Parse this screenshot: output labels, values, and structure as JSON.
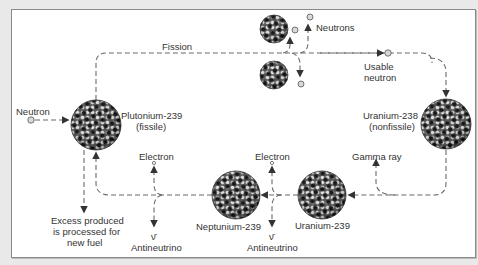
{
  "diagram": {
    "title_hint": "Plutonium breeding cycle",
    "colors": {
      "background": "#e9e9e9",
      "panel": "#ffffff",
      "line": "#6a6a6a",
      "text": "#333333",
      "proton": "#111111",
      "neutron_particle": "#dcdcdc"
    },
    "labels": {
      "fission": "Fission",
      "neutrons": "Neutrons",
      "usable_neutron_1": "Usable",
      "usable_neutron_2": "neutron",
      "neutron_in": "Neutron",
      "pu239_1": "Plutonium-239",
      "pu239_2": "(fissile)",
      "u238_1": "Uranium-238",
      "u238_2": "(nonfissile)",
      "gamma_ray": "Gamma ray",
      "electron_left": "Electron",
      "electron_right": "Electron",
      "nu_bar_left": "ν̄",
      "nu_bar_right": "ν̄",
      "antineutrino_left": "Antineutrino",
      "antineutrino_right": "Antineutrino",
      "np239": "Neptunium-239",
      "u239": "Uranium-239",
      "excess_1": "Excess produced",
      "excess_2": "is processed for",
      "excess_3": "new fuel"
    },
    "nuclei": [
      {
        "id": "plutonium-239",
        "cx": 96,
        "cy": 125,
        "r": 25
      },
      {
        "id": "uranium-238",
        "cx": 446,
        "cy": 124,
        "r": 25
      },
      {
        "id": "neptunium-239",
        "cx": 236,
        "cy": 195,
        "r": 24
      },
      {
        "id": "uranium-239",
        "cx": 322,
        "cy": 195,
        "r": 24
      },
      {
        "id": "fission-fragment-1",
        "cx": 274,
        "cy": 29,
        "r": 14
      },
      {
        "id": "fission-fragment-2",
        "cx": 274,
        "cy": 75,
        "r": 14
      }
    ]
  }
}
